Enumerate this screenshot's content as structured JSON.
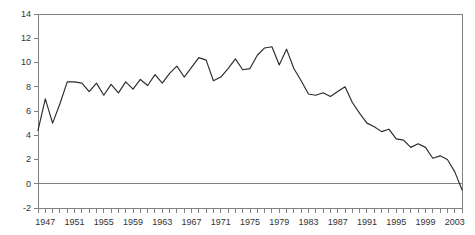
{
  "chart_data": {
    "type": "line",
    "title": "",
    "subtitle": "",
    "xlabel": "",
    "ylabel": "",
    "xlim": [
      1946,
      2004
    ],
    "ylim": [
      -2,
      14
    ],
    "grid": false,
    "legend": null,
    "y_ticks": [
      14,
      12,
      10,
      8,
      6,
      4,
      2,
      0,
      -2
    ],
    "y_tick_labels": [
      "14",
      "12",
      "10",
      "8",
      "6",
      "4",
      "2",
      "0",
      "-2"
    ],
    "x_tick_labels": [
      "1947",
      "1951",
      "1955",
      "1959",
      "1963",
      "1967",
      "1971",
      "1975",
      "1979",
      "1983",
      "1987",
      "1991",
      "1995",
      "1999",
      "2003"
    ],
    "x_tick_label_years": [
      1947,
      1951,
      1955,
      1959,
      1963,
      1967,
      1971,
      1975,
      1979,
      1983,
      1987,
      1991,
      1995,
      1999,
      2003
    ],
    "x_minor_tick_years": [
      1946,
      1947,
      1948,
      1949,
      1950,
      1951,
      1952,
      1953,
      1954,
      1955,
      1956,
      1957,
      1958,
      1959,
      1960,
      1961,
      1962,
      1963,
      1964,
      1965,
      1966,
      1967,
      1968,
      1969,
      1970,
      1971,
      1972,
      1973,
      1974,
      1975,
      1976,
      1977,
      1978,
      1979,
      1980,
      1981,
      1982,
      1983,
      1984,
      1985,
      1986,
      1987,
      1988,
      1989,
      1990,
      1991,
      1992,
      1993,
      1994,
      1995,
      1996,
      1997,
      1998,
      1999,
      2000,
      2001,
      2002,
      2003,
      2004
    ],
    "x": [
      1946,
      1947,
      1948,
      1949,
      1950,
      1951,
      1952,
      1953,
      1954,
      1955,
      1956,
      1957,
      1958,
      1959,
      1960,
      1961,
      1962,
      1963,
      1964,
      1965,
      1966,
      1967,
      1968,
      1969,
      1970,
      1971,
      1972,
      1973,
      1974,
      1975,
      1976,
      1977,
      1978,
      1979,
      1980,
      1981,
      1982,
      1983,
      1984,
      1985,
      1986,
      1987,
      1988,
      1989,
      1990,
      1991,
      1992,
      1993,
      1994,
      1995,
      1996,
      1997,
      1998,
      1999,
      2000,
      2001,
      2002,
      2003,
      2004
    ],
    "values": [
      4.4,
      7.0,
      5.0,
      6.6,
      8.4,
      8.4,
      8.3,
      7.6,
      8.3,
      7.3,
      8.2,
      7.5,
      8.4,
      7.8,
      8.6,
      8.1,
      9.0,
      8.3,
      9.1,
      9.7,
      8.8,
      9.6,
      10.4,
      10.2,
      8.5,
      8.8,
      9.5,
      10.3,
      9.4,
      9.5,
      10.6,
      11.2,
      11.3,
      9.8,
      11.1,
      9.5,
      8.5,
      7.4,
      7.3,
      7.5,
      7.2,
      7.6,
      8.0,
      6.7,
      5.8,
      5.0,
      4.7,
      4.3,
      4.5,
      3.7,
      3.6,
      3.0,
      3.3,
      3.0,
      2.1,
      2.3,
      2.0,
      1.0,
      -0.5
    ],
    "series_name": "value",
    "colors": {
      "line": "#2b2b2b",
      "axis": "#808080",
      "tick_label": "#333333",
      "background": "#ffffff"
    }
  },
  "geometry": {
    "plot_left": 38,
    "plot_right": 462,
    "plot_top": 14,
    "plot_bottom": 208,
    "zero_y": 186
  }
}
